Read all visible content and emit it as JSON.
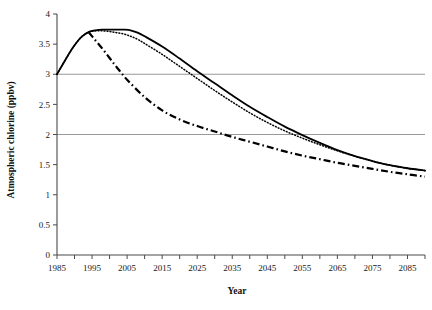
{
  "chart_data": {
    "type": "line",
    "title": "",
    "xlabel": "Year",
    "ylabel": "Atmospheric chlorine (ppbv)",
    "xlim": [
      1985,
      2090
    ],
    "ylim": [
      0,
      4
    ],
    "x_tick_step": 5,
    "x_label_step": 10,
    "y_tick_step": 0.5,
    "grid": "horizontal gridlines at y = 2 and y = 3 only",
    "legend": "none",
    "x_tick_labels": [
      "1985",
      "1995",
      "2005",
      "2015",
      "2025",
      "2035",
      "2045",
      "2055",
      "2065",
      "2075",
      "2085"
    ],
    "y_tick_labels": [
      "0",
      "0.5",
      "1",
      "1.5",
      "2",
      "2.5",
      "3",
      "3.5",
      "4"
    ],
    "gridline_values": [
      2,
      3
    ],
    "series": [
      {
        "name": "solid-scenario",
        "style": "solid",
        "color": "#000000",
        "x": [
          1985,
          1988,
          1990,
          1992,
          1994,
          1996,
          1998,
          2000,
          2002,
          2004,
          2006,
          2008,
          2010,
          2015,
          2020,
          2025,
          2030,
          2035,
          2040,
          2045,
          2050,
          2055,
          2060,
          2065,
          2070,
          2075,
          2080,
          2085,
          2090
        ],
        "y": [
          3.0,
          3.3,
          3.48,
          3.62,
          3.7,
          3.73,
          3.74,
          3.74,
          3.74,
          3.74,
          3.73,
          3.69,
          3.63,
          3.46,
          3.26,
          3.05,
          2.85,
          2.65,
          2.46,
          2.29,
          2.13,
          1.99,
          1.86,
          1.74,
          1.64,
          1.56,
          1.49,
          1.44,
          1.4
        ]
      },
      {
        "name": "dotted-scenario",
        "style": "dotted",
        "color": "#000000",
        "x": [
          1985,
          1988,
          1990,
          1992,
          1994,
          1996,
          1998,
          2000,
          2002,
          2004,
          2006,
          2008,
          2010,
          2015,
          2020,
          2025,
          2030,
          2035,
          2040,
          2045,
          2050,
          2055,
          2060,
          2065,
          2070,
          2075,
          2080,
          2085,
          2090
        ],
        "y": [
          3.0,
          3.3,
          3.48,
          3.62,
          3.7,
          3.72,
          3.72,
          3.71,
          3.69,
          3.67,
          3.63,
          3.58,
          3.51,
          3.33,
          3.13,
          2.93,
          2.73,
          2.54,
          2.36,
          2.2,
          2.06,
          1.94,
          1.83,
          1.73,
          1.64,
          1.56,
          1.49,
          1.44,
          1.4
        ]
      },
      {
        "name": "dash-dot-scenario",
        "style": "dash-dot",
        "color": "#000000",
        "x": [
          1994,
          1996,
          1998,
          2000,
          2002,
          2005,
          2010,
          2015,
          2020,
          2025,
          2030,
          2035,
          2040,
          2045,
          2050,
          2055,
          2060,
          2065,
          2070,
          2075,
          2080,
          2085,
          2090
        ],
        "y": [
          3.7,
          3.56,
          3.42,
          3.27,
          3.12,
          2.91,
          2.62,
          2.4,
          2.25,
          2.14,
          2.05,
          1.96,
          1.88,
          1.8,
          1.72,
          1.65,
          1.59,
          1.53,
          1.48,
          1.43,
          1.38,
          1.34,
          1.3
        ]
      }
    ]
  }
}
